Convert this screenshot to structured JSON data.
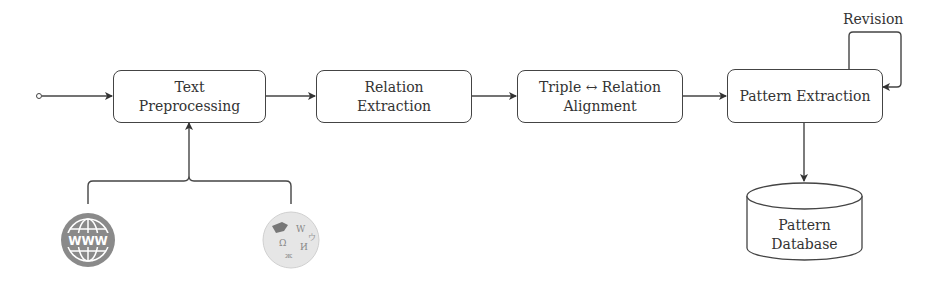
{
  "diagram": {
    "nodes": [
      {
        "id": "text-preprocessing",
        "line1": "Text",
        "line2": "Preprocessing"
      },
      {
        "id": "relation-extraction",
        "line1": "Relation",
        "line2": "Extraction"
      },
      {
        "id": "triple-relation-alignment",
        "line1": "Triple ↔ Relation",
        "line2": "Alignment"
      },
      {
        "id": "pattern-extraction",
        "line1": "Pattern Extraction"
      }
    ],
    "loop_label": "Revision",
    "database": {
      "line1": "Pattern",
      "line2": "Database"
    },
    "sources": [
      {
        "id": "www",
        "icon": "www-globe-icon",
        "text": "WWW"
      },
      {
        "id": "wikipedia",
        "icon": "wikipedia-globe-icon"
      }
    ],
    "colors": {
      "stroke": "#444444",
      "icon_gray": "#8a8a8a",
      "wiki_gray": "#d8d8d8"
    }
  }
}
